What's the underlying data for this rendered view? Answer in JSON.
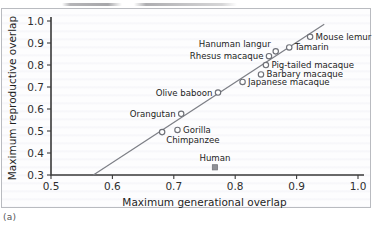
{
  "figure": {
    "caption": "(a)"
  },
  "chart_data": {
    "type": "scatter",
    "title": "",
    "xlabel": "Maximum generational overlap",
    "ylabel": "Maximum reproductive overlap",
    "xlim": [
      0.5,
      1.0
    ],
    "ylim": [
      0.3,
      1.0
    ],
    "xticks": [
      "0.5",
      "0.6",
      "0.7",
      "0.8",
      "0.9",
      "1.0"
    ],
    "yticks": [
      "0.3",
      "0.4",
      "0.5",
      "0.6",
      "0.7",
      "0.8",
      "0.9",
      "1.0"
    ],
    "grid": false,
    "legend": "none",
    "trend_line": {
      "x": [
        0.569,
        0.945
      ],
      "y": [
        0.3,
        0.985
      ],
      "style": "solid"
    },
    "points": [
      {
        "label": "Chimpanzee",
        "x": 0.681,
        "y": 0.495,
        "marker": "open-circle",
        "label_pos": "below"
      },
      {
        "label": "Gorilla",
        "x": 0.706,
        "y": 0.505,
        "marker": "open-circle",
        "label_pos": "right"
      },
      {
        "label": "Orangutan",
        "x": 0.712,
        "y": 0.578,
        "marker": "open-circle",
        "label_pos": "left"
      },
      {
        "label": "Olive baboon",
        "x": 0.772,
        "y": 0.675,
        "marker": "open-circle",
        "label_pos": "left"
      },
      {
        "label": "Japanese macaque",
        "x": 0.812,
        "y": 0.723,
        "marker": "open-circle",
        "label_pos": "right"
      },
      {
        "label": "Barbary macaque",
        "x": 0.842,
        "y": 0.757,
        "marker": "open-circle",
        "label_pos": "right"
      },
      {
        "label": "Pig-tailed macaque",
        "x": 0.85,
        "y": 0.8,
        "marker": "open-circle",
        "label_pos": "right"
      },
      {
        "label": "Rhesus macaque",
        "x": 0.855,
        "y": 0.84,
        "marker": "open-circle",
        "label_pos": "left"
      },
      {
        "label": "Hanuman langur",
        "x": 0.866,
        "y": 0.862,
        "marker": "open-circle",
        "label_pos": "above-left"
      },
      {
        "label": "Tamarin",
        "x": 0.888,
        "y": 0.88,
        "marker": "open-circle",
        "label_pos": "right"
      },
      {
        "label": "Mouse lemur",
        "x": 0.922,
        "y": 0.928,
        "marker": "open-circle",
        "label_pos": "right"
      },
      {
        "label": "Human",
        "x": 0.767,
        "y": 0.335,
        "marker": "filled-square",
        "label_pos": "above"
      }
    ]
  }
}
